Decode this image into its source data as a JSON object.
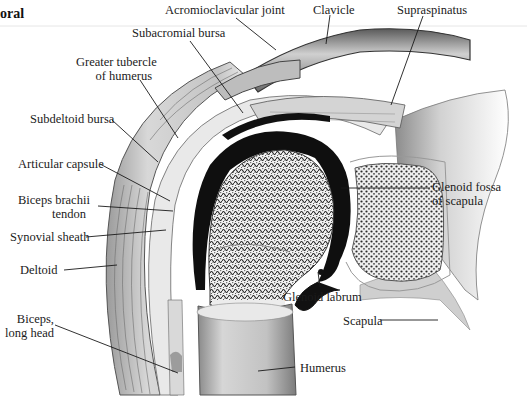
{
  "header": {
    "text": "oral"
  },
  "diagram": {
    "labels": {
      "acromioclavicular_joint": "Acromioclavicular joint",
      "clavicle": "Clavicle",
      "supraspinatus": "Supraspinatus",
      "subacromial_bursa": "Subacromial bursa",
      "greater_tubercle_1": "Greater tubercle",
      "greater_tubercle_2": "of humerus",
      "subdeltoid_bursa": "Subdeltoid bursa",
      "articular_capsule": "Articular capsule",
      "biceps_tendon_1": "Biceps brachii",
      "biceps_tendon_2": "tendon",
      "synovial_sheath": "Synovial sheath",
      "deltoid": "Deltoid",
      "biceps_long_1": "Biceps,",
      "biceps_long_2": "long head",
      "glenoid_fossa_1": "Glenoid fossa",
      "glenoid_fossa_2": "of scapula",
      "glenoid_labrum": "Glenoid labrum",
      "scapula": "Scapula",
      "humerus": "Humerus"
    },
    "colors": {
      "ink": "#1a1a1a",
      "bone_fill": "#e4e4e4",
      "cartilage": "#111111",
      "muscle": "#cfcfcf",
      "background": "#ffffff"
    }
  }
}
